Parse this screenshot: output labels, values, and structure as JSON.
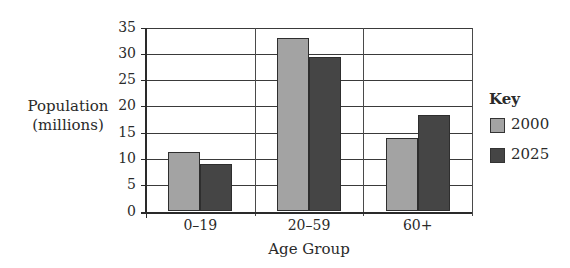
{
  "chart_data": {
    "type": "bar",
    "title": "",
    "xlabel": "Age Group",
    "ylabel": "Population (millions)",
    "ylabel_lines": [
      "Population",
      "(millions)"
    ],
    "categories": [
      "0–19",
      "20–59",
      "60+"
    ],
    "series": [
      {
        "name": "2000",
        "color": "#a3a3a3",
        "values": [
          11.3,
          33,
          14
        ]
      },
      {
        "name": "2025",
        "color": "#454545",
        "values": [
          9,
          29.3,
          18.4
        ]
      }
    ],
    "ylim": [
      0,
      35
    ],
    "yticks": [
      0,
      5,
      10,
      15,
      20,
      25,
      30,
      35
    ],
    "grid": true,
    "legend": {
      "title": "Key",
      "position": "right"
    }
  }
}
